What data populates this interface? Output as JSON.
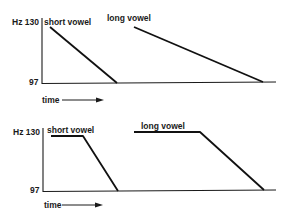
{
  "panels": [
    {
      "name": "falling-contour",
      "y_axis": {
        "top_label": "Hz 130",
        "bottom_label": "97"
      },
      "x_axis": {
        "label": "time"
      },
      "series": [
        {
          "label": "short vowel",
          "points": [
            [
              50,
              27
            ],
            [
              117,
              83
            ]
          ]
        },
        {
          "label": "long vowel",
          "points": [
            [
              134,
              27
            ],
            [
              263,
              82
            ]
          ]
        }
      ]
    },
    {
      "name": "level-then-falling-contour",
      "y_axis": {
        "top_label": "Hz 130",
        "bottom_label": "97"
      },
      "x_axis": {
        "label": "time"
      },
      "series": [
        {
          "label": "short vowel",
          "points": [
            [
              51,
              136
            ],
            [
              83,
              136
            ],
            [
              118,
              191
            ]
          ]
        },
        {
          "label": "long vowel",
          "points": [
            [
              134,
              132
            ],
            [
              200,
              132
            ],
            [
              264,
              190
            ]
          ]
        }
      ]
    }
  ],
  "colors": {
    "ink": "#111111",
    "background": "#ffffff"
  }
}
